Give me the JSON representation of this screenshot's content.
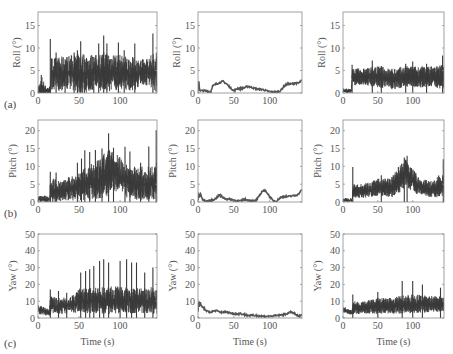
{
  "chart_data": [
    {
      "id": "a1",
      "row": 0,
      "col": 0,
      "type": "line",
      "panel_label": "(a)",
      "ylabel": "Roll (°)",
      "xlabel": "",
      "xlim": [
        0,
        145
      ],
      "ylim": [
        0,
        18
      ],
      "xticks": [
        0,
        50,
        100
      ],
      "yticks": [
        0,
        5,
        10,
        15
      ],
      "style": "noisy",
      "envelope": {
        "x": [
          0,
          5,
          10,
          15,
          16,
          25,
          40,
          55,
          70,
          85,
          100,
          115,
          130,
          145
        ],
        "base": [
          0.5,
          0.8,
          0.5,
          0.6,
          4,
          4,
          4.5,
          4,
          4.5,
          4.5,
          4.5,
          4,
          4.5,
          4.5
        ],
        "amp": [
          1,
          3,
          0.8,
          1,
          4,
          4,
          4,
          5,
          4,
          5,
          4,
          4,
          3,
          5
        ]
      },
      "spikes": [
        [
          4,
          4
        ],
        [
          15,
          12
        ],
        [
          22,
          9
        ],
        [
          33,
          7.5
        ],
        [
          44,
          9
        ],
        [
          48,
          9.5
        ],
        [
          52,
          11.5
        ],
        [
          68,
          8
        ],
        [
          74,
          11
        ],
        [
          80,
          12.8
        ],
        [
          84,
          11
        ],
        [
          98,
          11.2
        ],
        [
          105,
          9.5
        ],
        [
          118,
          11
        ],
        [
          140,
          13.2
        ]
      ]
    },
    {
      "id": "a2",
      "row": 0,
      "col": 1,
      "type": "line",
      "panel_label": "",
      "ylabel": "Roll (°)",
      "xlabel": "",
      "xlim": [
        0,
        145
      ],
      "ylim": [
        0,
        18
      ],
      "xticks": [
        0,
        50,
        100
      ],
      "yticks": [
        0,
        5,
        10,
        15
      ],
      "style": "smooth",
      "x": [
        0,
        1,
        2,
        3,
        5,
        10,
        18,
        20,
        25,
        30,
        35,
        40,
        45,
        50,
        55,
        60,
        65,
        70,
        75,
        80,
        85,
        90,
        95,
        100,
        105,
        110,
        115,
        120,
        125,
        130,
        135,
        140,
        145
      ],
      "y": [
        0.5,
        3,
        1,
        0.5,
        0.5,
        0.5,
        0.3,
        1.5,
        2,
        2.3,
        2.6,
        2,
        1.2,
        0.5,
        1,
        1,
        1.2,
        1.5,
        1.2,
        1,
        0.8,
        0.8,
        0.5,
        0.3,
        0.2,
        0.2,
        0.5,
        1.5,
        2,
        2,
        2.2,
        2.2,
        2.8
      ]
    },
    {
      "id": "a3",
      "row": 0,
      "col": 2,
      "type": "line",
      "panel_label": "",
      "ylabel": "Roll (°)",
      "xlabel": "",
      "xlim": [
        0,
        145
      ],
      "ylim": [
        0,
        18
      ],
      "xticks": [
        0,
        50,
        100
      ],
      "yticks": [
        0,
        5,
        10,
        15
      ],
      "style": "noisy",
      "envelope": {
        "x": [
          0,
          12,
          13,
          30,
          50,
          70,
          90,
          110,
          130,
          145
        ],
        "base": [
          0.5,
          0.5,
          3.5,
          3.5,
          3.5,
          3,
          3.5,
          3.5,
          3.5,
          3.5
        ],
        "amp": [
          0.5,
          0.5,
          2,
          2,
          2.5,
          2.5,
          2.5,
          2.5,
          2.5,
          3
        ]
      },
      "spikes": [
        [
          13,
          6.3
        ],
        [
          42,
          7.2
        ],
        [
          55,
          6
        ],
        [
          90,
          6.5
        ],
        [
          100,
          7
        ],
        [
          120,
          6.5
        ],
        [
          143,
          8.3
        ]
      ]
    },
    {
      "id": "b1",
      "row": 1,
      "col": 0,
      "type": "line",
      "panel_label": "(b)",
      "ylabel": "Pitch (°)",
      "xlabel": "",
      "xlim": [
        0,
        145
      ],
      "ylim": [
        0,
        23
      ],
      "xticks": [
        0,
        50,
        100
      ],
      "yticks": [
        0,
        5,
        10,
        15,
        20
      ],
      "style": "noisy",
      "envelope": {
        "x": [
          0,
          14,
          15,
          30,
          45,
          60,
          75,
          85,
          95,
          105,
          120,
          135,
          145
        ],
        "base": [
          0.8,
          0.8,
          3,
          3,
          4,
          5,
          6,
          8,
          8,
          6,
          5,
          5,
          6
        ],
        "amp": [
          1,
          1,
          4,
          3,
          4,
          5,
          6,
          7,
          6,
          5,
          5,
          5,
          6
        ]
      },
      "spikes": [
        [
          15,
          8.5
        ],
        [
          22,
          8.3
        ],
        [
          48,
          11
        ],
        [
          53,
          12.2
        ],
        [
          57,
          14.5
        ],
        [
          63,
          14
        ],
        [
          70,
          14.6
        ],
        [
          78,
          15
        ],
        [
          86,
          19.3
        ],
        [
          92,
          15.2
        ],
        [
          106,
          15.5
        ],
        [
          112,
          14.2
        ],
        [
          125,
          11
        ],
        [
          135,
          15.6
        ],
        [
          144,
          20
        ]
      ],
      "hole": {
        "x0": 84,
        "x1": 96,
        "depth": 4
      }
    },
    {
      "id": "b2",
      "row": 1,
      "col": 1,
      "type": "line",
      "panel_label": "",
      "ylabel": "Pitch (°)",
      "xlabel": "",
      "xlim": [
        0,
        145
      ],
      "ylim": [
        0,
        23
      ],
      "xticks": [
        0,
        50,
        100
      ],
      "yticks": [
        0,
        5,
        10,
        15,
        20
      ],
      "style": "smooth",
      "x": [
        0,
        1,
        2,
        4,
        6,
        10,
        15,
        20,
        25,
        30,
        35,
        40,
        45,
        50,
        55,
        60,
        65,
        70,
        75,
        80,
        85,
        90,
        95,
        100,
        105,
        110,
        115,
        120,
        125,
        130,
        135,
        140,
        145
      ],
      "y": [
        0.5,
        2.5,
        1.5,
        2.2,
        0.8,
        0.2,
        0.3,
        0.5,
        1,
        2,
        1.2,
        0.8,
        0.8,
        0.5,
        0.3,
        0.3,
        0.8,
        0.5,
        0.3,
        0.3,
        1.5,
        3.2,
        3,
        1.5,
        0.3,
        0.3,
        1.3,
        1.5,
        1.5,
        1.7,
        1.8,
        2.2,
        3.5
      ]
    },
    {
      "id": "b3",
      "row": 1,
      "col": 2,
      "type": "line",
      "panel_label": "",
      "ylabel": "Pitch (°)",
      "xlabel": "",
      "xlim": [
        0,
        145
      ],
      "ylim": [
        0,
        23
      ],
      "xticks": [
        0,
        50,
        100
      ],
      "yticks": [
        0,
        5,
        10,
        15,
        20
      ],
      "style": "noisy",
      "envelope": {
        "x": [
          0,
          13,
          14,
          30,
          50,
          70,
          80,
          90,
          100,
          110,
          130,
          145
        ],
        "base": [
          0.5,
          0.5,
          3,
          3,
          4,
          4,
          6,
          8,
          6,
          4,
          3.5,
          5
        ],
        "amp": [
          0.6,
          0.6,
          2,
          2.2,
          2.5,
          3,
          4,
          4,
          3.5,
          2.5,
          2.5,
          4
        ]
      },
      "spikes": [
        [
          14,
          9.8
        ],
        [
          55,
          7.5
        ],
        [
          88,
          12.5
        ],
        [
          92,
          13
        ],
        [
          144,
          12
        ]
      ],
      "hole": {
        "x0": 83,
        "x1": 97,
        "depth": 4
      }
    },
    {
      "id": "c1",
      "row": 2,
      "col": 0,
      "type": "line",
      "panel_label": "(c)",
      "ylabel": "Yaw (°)",
      "xlabel": "Time (s)",
      "xlim": [
        0,
        145
      ],
      "ylim": [
        0,
        50
      ],
      "xticks": [
        0,
        50,
        100
      ],
      "yticks": [
        0,
        10,
        20,
        30,
        40,
        50
      ],
      "style": "noisy",
      "envelope": {
        "x": [
          0,
          14,
          15,
          30,
          45,
          50,
          70,
          90,
          110,
          130,
          145
        ],
        "base": [
          5,
          3,
          7,
          7,
          8,
          10,
          10,
          10,
          10,
          10,
          10
        ],
        "amp": [
          3,
          2,
          6,
          5,
          6,
          8,
          8,
          9,
          8,
          8,
          9
        ]
      },
      "spikes": [
        [
          15,
          17
        ],
        [
          25,
          16
        ],
        [
          35,
          15
        ],
        [
          52,
          27
        ],
        [
          58,
          28
        ],
        [
          63,
          29
        ],
        [
          68,
          31
        ],
        [
          75,
          34
        ],
        [
          80,
          35
        ],
        [
          86,
          33
        ],
        [
          100,
          34
        ],
        [
          108,
          35
        ],
        [
          114,
          33
        ],
        [
          120,
          33
        ],
        [
          130,
          27
        ],
        [
          140,
          30
        ]
      ]
    },
    {
      "id": "c2",
      "row": 2,
      "col": 1,
      "type": "line",
      "panel_label": "",
      "ylabel": "Yaw (°)",
      "xlabel": "Time (s)",
      "xlim": [
        0,
        145
      ],
      "ylim": [
        0,
        50
      ],
      "xticks": [
        0,
        50,
        100
      ],
      "yticks": [
        0,
        10,
        20,
        30,
        40,
        50
      ],
      "style": "smooth",
      "x": [
        0,
        1,
        2,
        3,
        5,
        8,
        12,
        18,
        25,
        30,
        40,
        50,
        60,
        70,
        80,
        90,
        100,
        110,
        120,
        130,
        135,
        140,
        145
      ],
      "y": [
        4,
        11,
        6,
        9,
        7,
        6,
        4,
        3.5,
        4.5,
        3.5,
        3.5,
        2.5,
        2.5,
        1.5,
        1.5,
        1,
        1,
        1.5,
        2,
        3.5,
        2.5,
        1,
        1.5
      ]
    },
    {
      "id": "c3",
      "row": 2,
      "col": 2,
      "type": "line",
      "panel_label": "",
      "ylabel": "Yaw (°)",
      "xlabel": "Time (s)",
      "xlim": [
        0,
        145
      ],
      "ylim": [
        0,
        50
      ],
      "xticks": [
        0,
        50,
        100
      ],
      "yticks": [
        0,
        10,
        20,
        30,
        40,
        50
      ],
      "style": "noisy",
      "envelope": {
        "x": [
          0,
          13,
          14,
          30,
          50,
          70,
          90,
          110,
          130,
          145
        ],
        "base": [
          5,
          3,
          6,
          6,
          7,
          7,
          8,
          8,
          8,
          8
        ],
        "amp": [
          2,
          1.5,
          4,
          4,
          5,
          5,
          6,
          6,
          5,
          5
        ]
      },
      "spikes": [
        [
          14,
          14
        ],
        [
          50,
          15.5
        ],
        [
          85,
          22
        ],
        [
          100,
          22
        ],
        [
          114,
          20
        ],
        [
          140,
          18
        ]
      ]
    }
  ],
  "layout": {
    "cols_x": [
      [
        38,
        157
      ],
      [
        198,
        302
      ],
      [
        343,
        444
      ]
    ],
    "rows_y": [
      [
        12,
        93
      ],
      [
        120,
        202
      ],
      [
        234,
        318
      ]
    ],
    "trace_color": "#3a3a3a",
    "smooth_color": "#555555",
    "axis_color": "#8a8a8a"
  }
}
